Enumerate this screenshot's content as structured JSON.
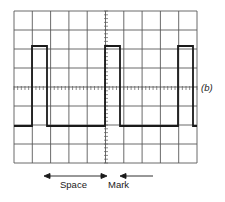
{
  "figure": {
    "panel_label": "(b)",
    "grid": {
      "columns": 10,
      "rows": 8,
      "x0": 14,
      "y0": 11,
      "x1": 197,
      "y1": 163,
      "center_x": 106,
      "center_y": 88
    },
    "waveform": {
      "high_y": 46,
      "low_y": 126,
      "pulses": [
        {
          "rise_x": 32,
          "fall_x": 47
        },
        {
          "rise_x": 105,
          "fall_x": 120
        },
        {
          "rise_x": 178,
          "fall_x": 193
        }
      ],
      "start_x": 14,
      "end_x": 197
    },
    "annotations": {
      "space_label": "Space",
      "mark_label": "Mark"
    },
    "colors": {
      "grid": "#5a5a5a",
      "trace": "#1a1a1a",
      "background": "#ffffff"
    }
  }
}
